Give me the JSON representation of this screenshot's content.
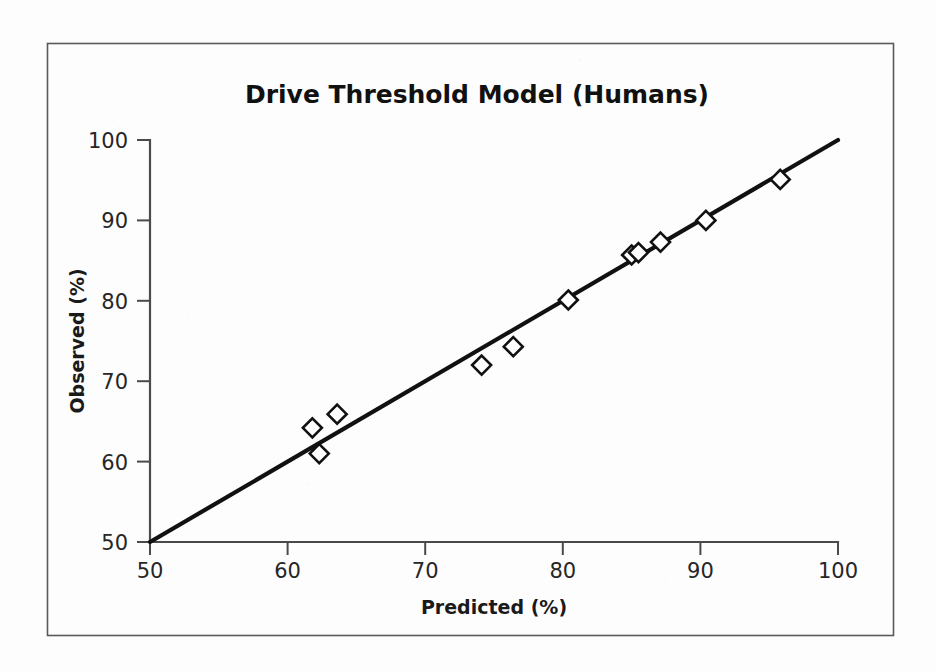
{
  "figure": {
    "title": "Drive Threshold Model (Humans)",
    "background_color": "#fdfdfd",
    "frame_color": "#5a5a5a",
    "ink_color": "#111111"
  },
  "chart_data": {
    "type": "scatter",
    "title": "Drive Threshold Model (Humans)",
    "xlabel": "Predicted (%)",
    "ylabel": "Observed (%)",
    "xlim": [
      50,
      100
    ],
    "ylim": [
      50,
      100
    ],
    "xticks": [
      50,
      60,
      70,
      80,
      90,
      100
    ],
    "yticks": [
      50,
      60,
      70,
      80,
      90,
      100
    ],
    "xtick_labels": [
      "50",
      "60",
      "70",
      "80",
      "90",
      "100"
    ],
    "ytick_labels": [
      "50",
      "60",
      "70",
      "80",
      "90",
      "100"
    ],
    "grid": false,
    "legend": false,
    "marker": "open-diamond",
    "series": [
      {
        "name": "Observations",
        "marker": "open-diamond",
        "points": [
          {
            "x": 61.8,
            "y": 64.2
          },
          {
            "x": 62.3,
            "y": 61.0
          },
          {
            "x": 63.6,
            "y": 65.9
          },
          {
            "x": 74.1,
            "y": 72.0
          },
          {
            "x": 76.4,
            "y": 74.3
          },
          {
            "x": 80.4,
            "y": 80.1
          },
          {
            "x": 85.0,
            "y": 85.7
          },
          {
            "x": 85.5,
            "y": 86.0
          },
          {
            "x": 87.1,
            "y": 87.3
          },
          {
            "x": 90.4,
            "y": 90.0
          },
          {
            "x": 95.8,
            "y": 95.1
          }
        ]
      }
    ],
    "reference_line": {
      "name": "identity-line",
      "type": "line",
      "from": {
        "x": 50,
        "y": 50
      },
      "to": {
        "x": 100,
        "y": 100
      }
    }
  }
}
